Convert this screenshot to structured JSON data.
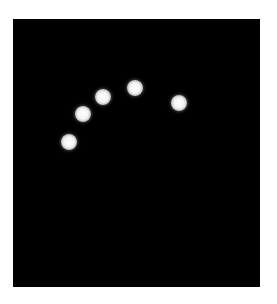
{
  "image": {
    "background_color": "#ffffff",
    "panel": {
      "color": "#000000",
      "left": 13,
      "top": 19,
      "width": 247,
      "height": 268
    },
    "dot_color": "#ffffff",
    "dot_diameter": 16,
    "dots": [
      {
        "x": 69,
        "y": 142
      },
      {
        "x": 83,
        "y": 114
      },
      {
        "x": 103,
        "y": 97
      },
      {
        "x": 135,
        "y": 88
      },
      {
        "x": 179,
        "y": 103
      }
    ]
  }
}
